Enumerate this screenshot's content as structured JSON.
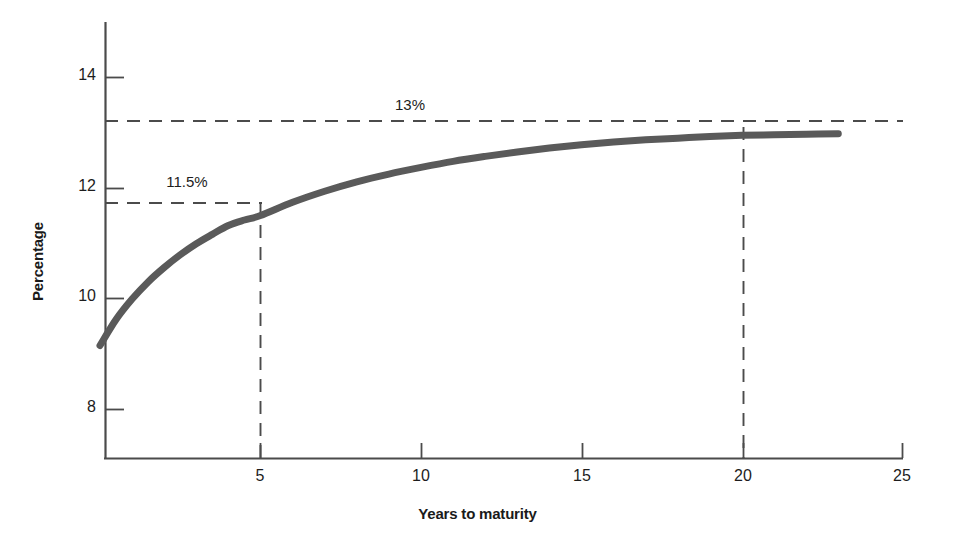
{
  "chart_data": {
    "type": "line",
    "title": "",
    "subtitle": "",
    "xlabel": "Years to maturity",
    "ylabel": "Percentage",
    "xlim": [
      0,
      25
    ],
    "ylim": [
      7.0,
      15.0
    ],
    "grid": false,
    "legend": false,
    "legend_position": "none",
    "x_ticks": [
      5,
      10,
      15,
      20,
      25
    ],
    "x_tick_labels": [
      "5",
      "10",
      "15",
      "20",
      "25"
    ],
    "y_ticks": [
      8,
      10,
      12,
      14
    ],
    "y_tick_labels": [
      "8",
      "10",
      "12",
      "14"
    ],
    "series": [
      {
        "name": "Yield curve",
        "color": "#5a5a5a",
        "linewidth": 7,
        "x": [
          0,
          0.5,
          1,
          1.5,
          2,
          2.5,
          3,
          3.5,
          4,
          4.5,
          5,
          6,
          7,
          8,
          9,
          10,
          11,
          12,
          13,
          14,
          15,
          16,
          17,
          18,
          19,
          20,
          21,
          22,
          23
        ],
        "y": [
          9.15,
          9.62,
          9.99,
          10.3,
          10.56,
          10.79,
          10.99,
          11.16,
          11.32,
          11.42,
          11.5,
          11.74,
          11.94,
          12.11,
          12.25,
          12.37,
          12.48,
          12.57,
          12.65,
          12.72,
          12.78,
          12.83,
          12.87,
          12.9,
          12.93,
          12.95,
          12.96,
          12.97,
          12.98
        ]
      }
    ],
    "annotations": [
      {
        "name": "upper-asymptote",
        "label": "13%",
        "value": 13.0,
        "orientation": "horizontal",
        "style": "dashed",
        "x_from": 0,
        "x_to": 25,
        "label_x": 11.5,
        "label_y": 13.55
      },
      {
        "name": "five-year-yield",
        "label": "11.5%",
        "value": 11.5,
        "orientation": "horizontal",
        "style": "dashed",
        "x_from": 0,
        "x_to": 5,
        "label_x": 2.45,
        "label_y": 12.05
      },
      {
        "name": "five-year-marker",
        "label": "",
        "value": 5,
        "orientation": "vertical",
        "style": "dashed",
        "y_from": 7.0,
        "y_to": 11.5
      },
      {
        "name": "twenty-year-marker",
        "label": "",
        "value": 20,
        "orientation": "vertical",
        "style": "dashed",
        "y_from": 7.0,
        "y_to": 13.0
      }
    ],
    "colors": {
      "curve": "#5a5a5a",
      "axis": "#4b4b4b",
      "dashed": "#4b4b4b",
      "text": "#1d1d1d",
      "background": "#ffffff"
    }
  }
}
